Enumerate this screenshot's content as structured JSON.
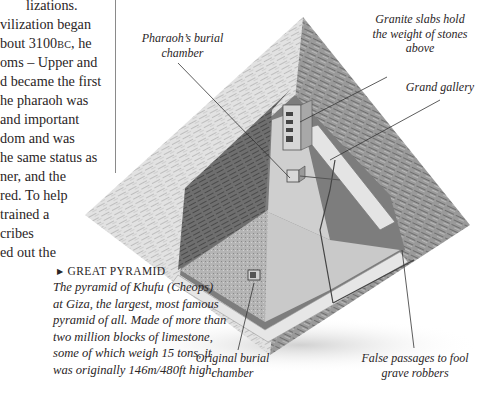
{
  "body_text": {
    "lines": [
      "lizations.",
      "vilization began",
      "bout 3100",
      "oms – Upper and",
      "d became the first",
      "he pharaoh was",
      " and important",
      "dom and was",
      "he same status as",
      "ner, and the",
      "red. To help",
      "trained a",
      "cribes",
      "ed out the"
    ],
    "era_abbrev": "BC",
    "era_suffix": ", he"
  },
  "caption": {
    "heading": "GREAT PYRAMID",
    "arrow_icon": "▶",
    "lines": [
      "The pyramid of Khufu (Cheops)",
      "at Giza, the largest, most famous",
      "pyramid of all. Made of more than",
      "two million blocks of limestone,",
      "some of which weigh 15 tons, it",
      "was originally 146m/480ft high."
    ]
  },
  "labels": {
    "pharaohs_chamber": [
      "Pharaoh’s burial",
      "chamber"
    ],
    "granite_slabs": [
      "Granite slabs hold",
      "the weight of stones",
      "above"
    ],
    "grand_gallery": [
      "Grand gallery"
    ],
    "original_chamber": [
      "Original burial",
      "chamber"
    ],
    "false_passages": [
      "False passages to fool",
      "grave robbers"
    ]
  },
  "colors": {
    "text": "#231f20",
    "pyramid_light": "#d9d9d9",
    "pyramid_dark": "#8c8c8c",
    "leader_line": "#333333"
  }
}
